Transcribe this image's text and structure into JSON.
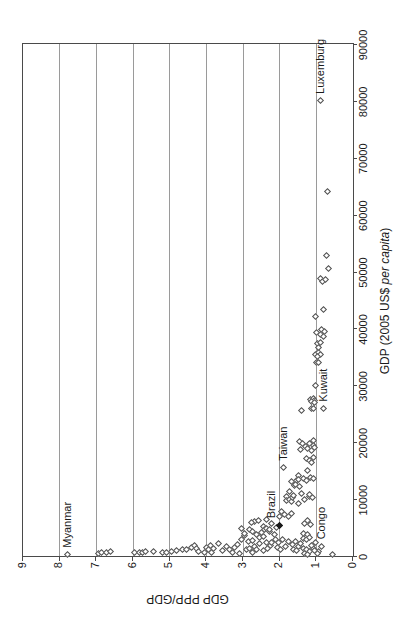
{
  "figure": {
    "orientation_note": "landscape scatter chart rotated 90 degrees counter-clockwise",
    "background": "#ffffff",
    "grid_color": "#9a9a9a",
    "frame_color": "#4a4a4a",
    "marker_color": "#4f4f4f",
    "text_color": "#1a1a1a"
  },
  "chart_data": {
    "type": "scatter",
    "title": "",
    "grid": "horizontal-only",
    "legend": "none",
    "x_axis": {
      "label_prefix": "GDP (2005 US$ ",
      "label_italic": "per capita",
      "label_suffix": ")",
      "min": 0,
      "max": 90000,
      "tick_step": 10000,
      "tick_labels": [
        "0",
        "10000",
        "20000",
        "30000",
        "40000",
        "50000",
        "60000",
        "70000",
        "80000",
        "90000"
      ]
    },
    "y_axis": {
      "label": "GDP PPP/GDP",
      "min": 0,
      "max": 9,
      "tick_step": 1,
      "tick_labels": [
        "0",
        "1",
        "2",
        "3",
        "4",
        "5",
        "6",
        "7",
        "8",
        "9"
      ]
    },
    "labeled_points": [
      {
        "name": "Myanmar",
        "gdp": 230,
        "ratio": 7.8,
        "filled": false,
        "dy": 0
      },
      {
        "name": "Congo",
        "gdp": 1700,
        "ratio": 0.85,
        "filled": false,
        "dy": 0
      },
      {
        "name": "Brazil",
        "gdp": 5400,
        "ratio": 2.0,
        "filled": true,
        "dy": -8
      },
      {
        "name": "Taiwan",
        "gdp": 15500,
        "ratio": 1.89,
        "filled": false,
        "dy": 0
      },
      {
        "name": "Kuwait",
        "gdp": 25900,
        "ratio": 0.8,
        "filled": false,
        "dy": 0
      },
      {
        "name": "Luxemburg",
        "gdp": 80000,
        "ratio": 0.88,
        "filled": false,
        "dy": 0
      }
    ],
    "points": [
      [
        470,
        6.95
      ],
      [
        560,
        6.85
      ],
      [
        650,
        6.72
      ],
      [
        740,
        6.62
      ],
      [
        560,
        5.95
      ],
      [
        650,
        5.82
      ],
      [
        700,
        5.74
      ],
      [
        800,
        5.67
      ],
      [
        750,
        5.43
      ],
      [
        650,
        5.2
      ],
      [
        700,
        5.1
      ],
      [
        850,
        4.95
      ],
      [
        930,
        4.82
      ],
      [
        1230,
        4.64
      ],
      [
        1100,
        4.55
      ],
      [
        1520,
        4.41
      ],
      [
        1930,
        4.32
      ],
      [
        1300,
        4.27
      ],
      [
        800,
        4.22
      ],
      [
        700,
        4.05
      ],
      [
        1520,
        4.0
      ],
      [
        1100,
        3.95
      ],
      [
        1810,
        3.9
      ],
      [
        700,
        3.86
      ],
      [
        1250,
        3.81
      ],
      [
        2280,
        3.68
      ],
      [
        900,
        3.55
      ],
      [
        1700,
        3.46
      ],
      [
        1200,
        3.36
      ],
      [
        700,
        3.3
      ],
      [
        1500,
        3.23
      ],
      [
        2100,
        3.15
      ],
      [
        2980,
        3.05
      ],
      [
        4900,
        3.05
      ],
      [
        500,
        3.1
      ],
      [
        3560,
        2.96
      ],
      [
        4030,
        2.96
      ],
      [
        1200,
        2.9
      ],
      [
        2560,
        2.86
      ],
      [
        1300,
        2.82
      ],
      [
        4600,
        2.82
      ],
      [
        2680,
        2.73
      ],
      [
        4330,
        2.73
      ],
      [
        600,
        2.75
      ],
      [
        1700,
        2.68
      ],
      [
        6075,
        2.68
      ],
      [
        1100,
        2.64
      ],
      [
        3730,
        2.64
      ],
      [
        5900,
        2.77
      ],
      [
        3300,
        2.55
      ],
      [
        2200,
        2.55
      ],
      [
        6180,
        2.59
      ],
      [
        4150,
        2.5
      ],
      [
        3450,
        2.45
      ],
      [
        5200,
        2.45
      ],
      [
        900,
        2.45
      ],
      [
        4600,
        2.41
      ],
      [
        2400,
        2.36
      ],
      [
        6480,
        2.36
      ],
      [
        4900,
        2.36
      ],
      [
        1400,
        2.33
      ],
      [
        4260,
        2.27
      ],
      [
        4600,
        2.27
      ],
      [
        1900,
        2.25
      ],
      [
        5780,
        2.23
      ],
      [
        2300,
        2.21
      ],
      [
        3700,
        2.14
      ],
      [
        2900,
        2.12
      ],
      [
        5000,
        2.09
      ],
      [
        1500,
        2.05
      ],
      [
        2300,
        2.02
      ],
      [
        6950,
        2.0
      ],
      [
        1100,
        1.98
      ],
      [
        7830,
        1.95
      ],
      [
        2900,
        1.93
      ],
      [
        7350,
        1.86
      ],
      [
        1600,
        1.84
      ],
      [
        7000,
        1.77
      ],
      [
        2600,
        1.76
      ],
      [
        7530,
        1.68
      ],
      [
        2000,
        1.66
      ],
      [
        1200,
        1.62
      ],
      [
        2500,
        1.58
      ],
      [
        900,
        1.54
      ],
      [
        1600,
        1.5
      ],
      [
        2200,
        1.44
      ],
      [
        10450,
        1.82
      ],
      [
        9800,
        1.82
      ],
      [
        9860,
        1.73
      ],
      [
        9600,
        1.68
      ],
      [
        10280,
        1.64
      ],
      [
        10700,
        1.63
      ],
      [
        12400,
        1.6
      ],
      [
        13300,
        1.55
      ],
      [
        14200,
        1.5
      ],
      [
        9280,
        1.49
      ],
      [
        13400,
        1.48
      ],
      [
        12250,
        1.46
      ],
      [
        11400,
        1.74
      ],
      [
        11000,
        1.41
      ],
      [
        13100,
        1.68
      ],
      [
        12600,
        1.57
      ],
      [
        10500,
        1.19
      ],
      [
        20100,
        1.46
      ],
      [
        19800,
        1.38
      ],
      [
        19300,
        1.3
      ],
      [
        18800,
        1.42
      ],
      [
        20300,
        1.08
      ],
      [
        19800,
        1.18
      ],
      [
        19500,
        1.09
      ],
      [
        18900,
        1.23
      ],
      [
        18600,
        1.14
      ],
      [
        19050,
        1.05
      ],
      [
        17150,
        1.27
      ],
      [
        16850,
        1.18
      ],
      [
        17300,
        1.09
      ],
      [
        16450,
        1.14
      ],
      [
        15100,
        1.23
      ],
      [
        13650,
        1.36
      ],
      [
        13350,
        1.27
      ],
      [
        13800,
        1.15
      ],
      [
        13550,
        1.09
      ],
      [
        10730,
        1.18
      ],
      [
        10270,
        1.11
      ],
      [
        9860,
        1.32
      ],
      [
        6180,
        1.23
      ],
      [
        5780,
        1.32
      ],
      [
        5480,
        1.15
      ],
      [
        4030,
        1.34
      ],
      [
        3730,
        1.25
      ],
      [
        3150,
        1.36
      ],
      [
        2850,
        1.27
      ],
      [
        3270,
        1.18
      ],
      [
        1400,
        1.36
      ],
      [
        1100,
        1.27
      ],
      [
        820,
        1.18
      ],
      [
        1280,
        1.09
      ],
      [
        525,
        1.32
      ],
      [
        230,
        1.23
      ],
      [
        820,
        0.95
      ],
      [
        430,
        0.97
      ],
      [
        300,
        0.55
      ],
      [
        1000,
        1.05
      ],
      [
        1900,
        1.12
      ],
      [
        2400,
        1.02
      ],
      [
        25500,
        1.41
      ],
      [
        25900,
        1.14
      ],
      [
        26000,
        1.09
      ],
      [
        27550,
        1.16
      ],
      [
        27660,
        1.09
      ],
      [
        27370,
        1.05
      ],
      [
        27080,
        1.12
      ],
      [
        26960,
        1.06
      ],
      [
        30000,
        1.02
      ],
      [
        34100,
        1.0
      ],
      [
        34000,
        0.93
      ],
      [
        35500,
        1.03
      ],
      [
        35700,
        0.95
      ],
      [
        35400,
        0.89
      ],
      [
        35000,
        0.97
      ],
      [
        37300,
        0.97
      ],
      [
        37500,
        0.88
      ],
      [
        36700,
        0.94
      ],
      [
        39300,
        1.0
      ],
      [
        38900,
        0.89
      ],
      [
        38600,
        0.8
      ],
      [
        39900,
        0.86
      ],
      [
        39450,
        0.79
      ],
      [
        42100,
        1.03
      ],
      [
        43300,
        0.8
      ],
      [
        48800,
        0.89
      ],
      [
        48200,
        0.82
      ],
      [
        48550,
        0.76
      ],
      [
        50600,
        0.67
      ],
      [
        52800,
        0.73
      ],
      [
        64100,
        0.7
      ]
    ]
  }
}
